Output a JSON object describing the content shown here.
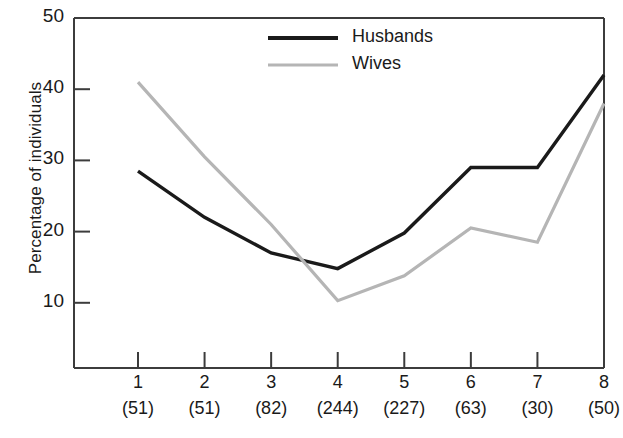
{
  "chart_data": {
    "type": "line",
    "title": "",
    "xlabel": "",
    "ylabel": "Percentage of individuals",
    "ylim": [
      0,
      50
    ],
    "yticks": [
      10,
      20,
      30,
      40,
      50
    ],
    "ytick_labels": [
      "10",
      "20",
      "30",
      "40",
      "50"
    ],
    "grid": false,
    "legend_position": "top-center",
    "categories": [
      "1",
      "2",
      "3",
      "4",
      "5",
      "6",
      "7",
      "8"
    ],
    "category_counts": [
      "(51)",
      "(51)",
      "(82)",
      "(244)",
      "(227)",
      "(63)",
      "(30)",
      "(50)"
    ],
    "series": [
      {
        "name": "Husbands",
        "color": "#1a1a1a",
        "values": [
          28.5,
          22.0,
          17.0,
          14.8,
          19.8,
          29.0,
          29.0,
          42.0
        ]
      },
      {
        "name": "Wives",
        "color": "#b5b5b5",
        "values": [
          41.0,
          30.5,
          21.0,
          10.3,
          13.8,
          20.5,
          18.5,
          38.0
        ]
      }
    ]
  },
  "axes": {
    "frame_color": "#3c3c3c"
  }
}
